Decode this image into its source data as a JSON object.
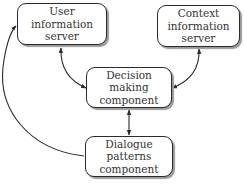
{
  "diagram": {
    "nodes": {
      "user_info_server": {
        "label": "User\ninformation\nserver"
      },
      "context_info_server": {
        "label": "Context\ninformation\nserver"
      },
      "decision_making": {
        "label": "Decision\nmaking\ncomponent"
      },
      "dialogue_patterns": {
        "label": "Dialogue\npatterns\ncomponent"
      }
    },
    "edges": [
      {
        "from": "user_info_server",
        "to": "decision_making",
        "direction": "bidirectional"
      },
      {
        "from": "context_info_server",
        "to": "decision_making",
        "direction": "bidirectional"
      },
      {
        "from": "decision_making",
        "to": "dialogue_patterns",
        "direction": "bidirectional"
      },
      {
        "from": "dialogue_patterns",
        "to": "user_info_server",
        "direction": "one-way"
      }
    ],
    "colors": {
      "stroke": "#2b2b2b",
      "text": "#333333",
      "shadow": "#9a9a9a"
    }
  }
}
